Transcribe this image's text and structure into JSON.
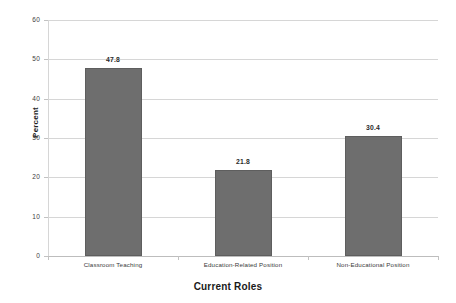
{
  "chart_data": {
    "type": "bar",
    "title": "",
    "subtitle": "",
    "xlabel": "Current Roles",
    "ylabel": "Percent",
    "categories": [
      "Classroom Teaching",
      "Education-Related Position",
      "Non-Educational Position"
    ],
    "values": [
      47.8,
      21.8,
      30.4
    ],
    "data_labels": [
      "47.8",
      "21.8",
      "30.4"
    ],
    "ylim": [
      0,
      60
    ],
    "yticks": [
      0,
      10,
      20,
      30,
      40,
      50,
      60
    ],
    "ytick_labels": [
      "0",
      "10",
      "20",
      "30",
      "40",
      "50",
      "60"
    ],
    "grid": "horizontal",
    "legend": "none",
    "series": [
      {
        "name": "Percent",
        "values": [
          47.8,
          21.8,
          30.4
        ],
        "color": "#6e6e6e"
      }
    ],
    "colors": {
      "bar_fill": "#6e6e6e",
      "bar_edge": "#5e5e5e",
      "gridline": "#d6d6d6",
      "axis": "#c2c2c2",
      "background": "#ffffff",
      "text": "#2b2b2b"
    }
  }
}
